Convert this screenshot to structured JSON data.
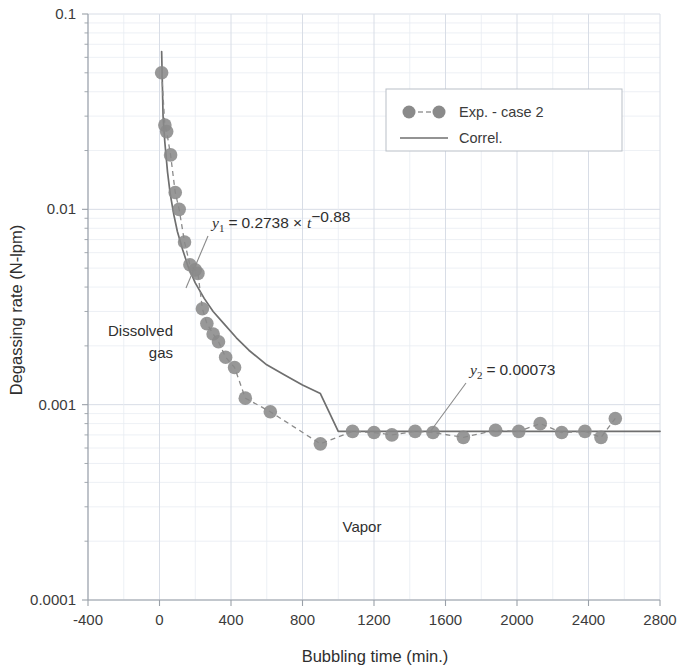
{
  "chart_data": {
    "type": "scatter",
    "title": "",
    "xlabel": "Bubbling time (min.)",
    "ylabel": "Degassing rate (N-lpm)",
    "xscale": "linear",
    "yscale": "log",
    "xlim": [
      -400,
      2800
    ],
    "ylim": [
      0.0001,
      0.1
    ],
    "grid": true,
    "legend_position": "top-right",
    "x_ticks": [
      "-400",
      "0",
      "400",
      "800",
      "1200",
      "1600",
      "2000",
      "2400",
      "2800"
    ],
    "x_tick_values": [
      -400,
      0,
      400,
      800,
      1200,
      1600,
      2000,
      2400,
      2800
    ],
    "y_ticks": [
      "0.1",
      "0.01",
      "0.001",
      "0.0001"
    ],
    "y_tick_values": [
      0.1,
      0.01,
      0.001,
      0.0001
    ],
    "series": [
      {
        "name": "Exp. - case 2",
        "style": "dashed-line-with-markers",
        "color": "#8a8a8a",
        "marker": "circle",
        "x": [
          12,
          30,
          40,
          62,
          88,
          110,
          140,
          170,
          200,
          215,
          240,
          265,
          300,
          330,
          370,
          420,
          480,
          620,
          900,
          1080,
          1200,
          1300,
          1430,
          1530,
          1700,
          1880,
          2010,
          2130,
          2250,
          2380,
          2470,
          2550
        ],
        "y": [
          0.05,
          0.027,
          0.025,
          0.019,
          0.0122,
          0.01,
          0.0068,
          0.0052,
          0.0049,
          0.0047,
          0.0031,
          0.0026,
          0.0023,
          0.0021,
          0.00175,
          0.00155,
          0.00108,
          0.00092,
          0.00063,
          0.00073,
          0.00072,
          0.0007,
          0.00073,
          0.00072,
          0.00068,
          0.00074,
          0.00073,
          0.0008,
          0.00072,
          0.00073,
          0.00068,
          0.00085
        ]
      },
      {
        "name": "Correl.",
        "style": "solid-line",
        "color": "#6f6f6f",
        "x": [
          12,
          20,
          30,
          45,
          60,
          80,
          100,
          130,
          160,
          200,
          250,
          300,
          360,
          430,
          500,
          600,
          700,
          800,
          900,
          1000,
          2800
        ],
        "y": [
          0.0642,
          0.03,
          0.022,
          0.0155,
          0.012,
          0.0094,
          0.0077,
          0.0062,
          0.0051,
          0.0042,
          0.0035,
          0.003,
          0.0026,
          0.0022,
          0.0019,
          0.0016,
          0.00142,
          0.00126,
          0.00114,
          0.00073,
          0.00073
        ]
      }
    ],
    "annotations": [
      {
        "name": "equation-1",
        "text": "y1 = 0.2738 x t^-0.88",
        "parts": {
          "lhs": "y",
          "sub": "1",
          "eq": "=",
          "coef": "0.2738",
          "times": "×",
          "var": "t",
          "exp": "−0.88"
        },
        "x_px": 212,
        "y_px": 228,
        "leader_to": {
          "x_px": 186,
          "y_px": 288
        }
      },
      {
        "name": "equation-2",
        "text": "y2 = 0.00073",
        "parts": {
          "lhs": "y",
          "sub": "2",
          "eq": "=",
          "value": "0.00073"
        },
        "x_px": 470,
        "y_px": 375,
        "leader_to": {
          "x_px": 430,
          "y_px": 432
        }
      },
      {
        "name": "region-label-dissolved-gas",
        "text_line1": "Dissolved",
        "text_line2": "gas",
        "x_px": 170,
        "y_px": 335
      },
      {
        "name": "region-label-vapor",
        "text": "Vapor",
        "x_px": 360,
        "y_px": 527
      }
    ]
  },
  "legend": {
    "items": [
      {
        "label": "Exp. - case 2",
        "marker": "circle",
        "line": "dashed"
      },
      {
        "label": "Correl.",
        "marker": "none",
        "line": "solid"
      }
    ]
  },
  "colors": {
    "marker": "#8a8a8a",
    "correl_line": "#6f6f6f",
    "grid_major": "#d8dde6",
    "grid_minor": "#e8ecf2",
    "axis": "#9aa0a8",
    "text": "#3a3a3a",
    "background": "#ffffff"
  }
}
